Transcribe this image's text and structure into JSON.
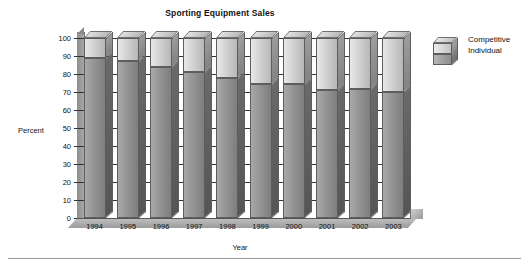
{
  "chart_data": {
    "type": "bar",
    "title": "Sporting Equipment Sales",
    "xlabel": "Year",
    "ylabel": "Percent",
    "categories": [
      "1994",
      "1995",
      "1996",
      "1997",
      "1998",
      "1999",
      "2000",
      "2001",
      "2002",
      "2003"
    ],
    "series": [
      {
        "name": "Individual",
        "values": [
          89,
          87,
          84,
          81,
          78,
          74.5,
          74.5,
          71,
          71.5,
          70
        ]
      },
      {
        "name": "Competitive",
        "values": [
          11,
          13,
          16,
          19,
          22,
          25.5,
          25.5,
          29,
          28.5,
          30
        ]
      }
    ],
    "stacked": true,
    "ylim": [
      0,
      100
    ],
    "ytick_step": 10,
    "yticks": [
      "100",
      "90",
      "80",
      "70",
      "60",
      "50",
      "40",
      "30",
      "20",
      "10",
      "0"
    ],
    "grid": true,
    "legend_position": "right",
    "legend_entries": [
      "Competitive",
      "Individual"
    ],
    "style": "3d-stacked-column",
    "colors": {
      "competitive": "#d2d2d2",
      "individual": "#949494",
      "gridline": "#333333",
      "text": "#111111",
      "background": "#ffffff"
    }
  }
}
